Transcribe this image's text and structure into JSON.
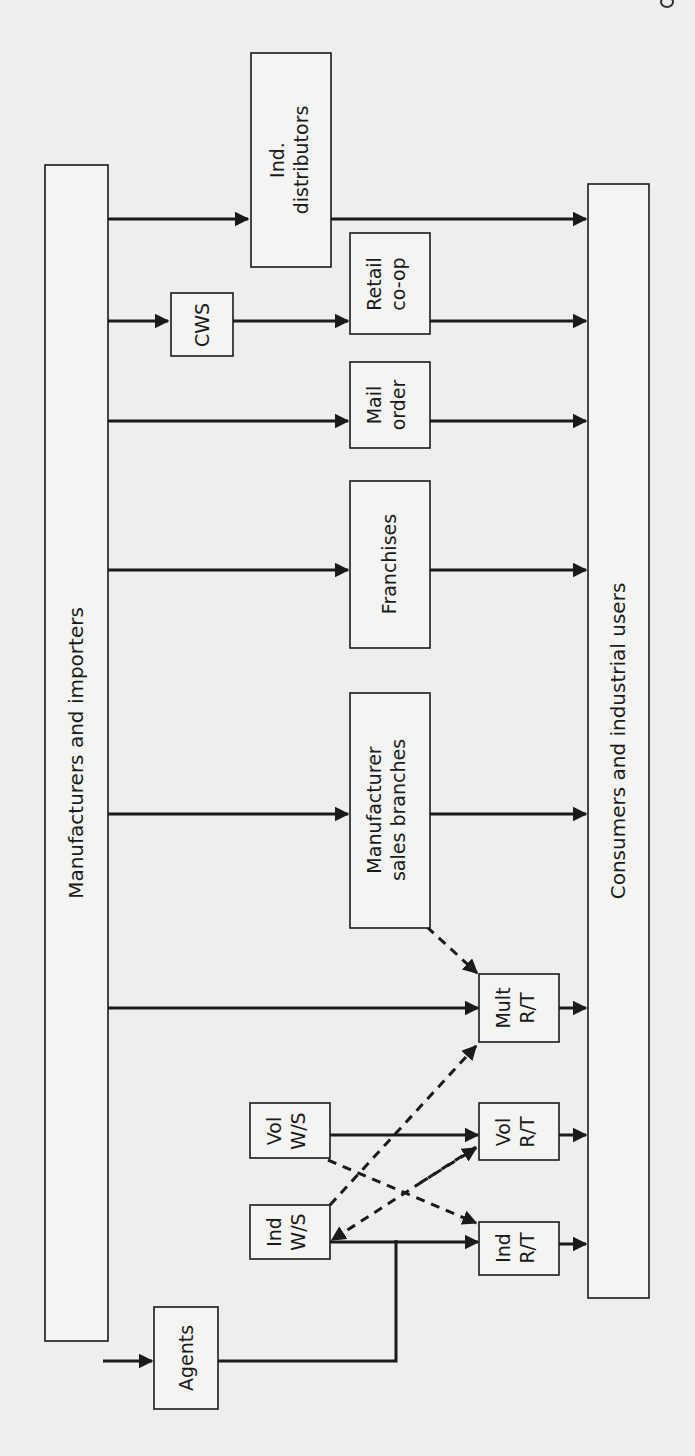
{
  "diagram": {
    "nodes": {
      "manufacturers": {
        "label": "Manufacturers and importers"
      },
      "consumers": {
        "label": "Consumers and industrial users"
      },
      "ind_distributors": {
        "line1": "Ind.",
        "line2": "distributors"
      },
      "cws": {
        "label": "CWS"
      },
      "retail_coop": {
        "line1": "Retail",
        "line2": "co-op"
      },
      "mail_order": {
        "line1": "Mail",
        "line2": "order"
      },
      "franchises": {
        "label": "Franchises"
      },
      "mfr_sales_branches": {
        "line1": "Manufacturer",
        "line2": "sales branches"
      },
      "mult_rt": {
        "line1": "Mult",
        "line2": "R/T"
      },
      "vol_ws": {
        "line1": "Vol",
        "line2": "W/S"
      },
      "vol_rt": {
        "line1": "Vol",
        "line2": "R/T"
      },
      "ind_ws": {
        "line1": "Ind",
        "line2": "W/S"
      },
      "ind_rt": {
        "line1": "Ind",
        "line2": "R/T"
      },
      "agents": {
        "label": "Agents"
      }
    },
    "edges": [
      {
        "from": "Manufacturers and importers",
        "to": "Ind. distributors",
        "style": "solid"
      },
      {
        "from": "Ind. distributors",
        "to": "Consumers and industrial users",
        "style": "solid"
      },
      {
        "from": "Manufacturers and importers",
        "to": "CWS",
        "style": "solid"
      },
      {
        "from": "CWS",
        "to": "Retail co-op",
        "style": "solid"
      },
      {
        "from": "Retail co-op",
        "to": "Consumers and industrial users",
        "style": "solid"
      },
      {
        "from": "Manufacturers and importers",
        "to": "Mail order",
        "style": "solid"
      },
      {
        "from": "Mail order",
        "to": "Consumers and industrial users",
        "style": "solid"
      },
      {
        "from": "Manufacturers and importers",
        "to": "Franchises",
        "style": "solid"
      },
      {
        "from": "Franchises",
        "to": "Consumers and industrial users",
        "style": "solid"
      },
      {
        "from": "Manufacturers and importers",
        "to": "Manufacturer sales branches",
        "style": "solid"
      },
      {
        "from": "Manufacturer sales branches",
        "to": "Consumers and industrial users",
        "style": "solid"
      },
      {
        "from": "Manufacturer sales branches",
        "to": "Mult R/T",
        "style": "dashed"
      },
      {
        "from": "Manufacturers and importers",
        "to": "Mult R/T",
        "style": "solid"
      },
      {
        "from": "Mult R/T",
        "to": "Consumers and industrial users",
        "style": "solid"
      },
      {
        "from": "Manufacturers and importers",
        "to": "Vol W/S",
        "style": "solid"
      },
      {
        "from": "Vol W/S",
        "to": "Vol R/T",
        "style": "solid"
      },
      {
        "from": "Vol W/S",
        "to": "Ind R/T",
        "style": "dashed"
      },
      {
        "from": "Vol R/T",
        "to": "Consumers and industrial users",
        "style": "solid"
      },
      {
        "from": "Manufacturers and importers",
        "to": "Ind W/S",
        "style": "solid"
      },
      {
        "from": "Ind W/S",
        "to": "Ind R/T",
        "style": "solid"
      },
      {
        "from": "Ind W/S",
        "to": "Mult R/T",
        "style": "dashed"
      },
      {
        "from": "Ind R/T",
        "to": "Ind W/S",
        "style": "dashed"
      },
      {
        "from": "Ind W/S",
        "to": "Vol R/T",
        "style": "dashed"
      },
      {
        "from": "Ind R/T",
        "to": "Consumers and industrial users",
        "style": "solid"
      },
      {
        "from": "Manufacturers and importers",
        "to": "Agents",
        "style": "solid"
      },
      {
        "from": "Agents",
        "to": "Ind R/T",
        "style": "solid"
      }
    ]
  }
}
